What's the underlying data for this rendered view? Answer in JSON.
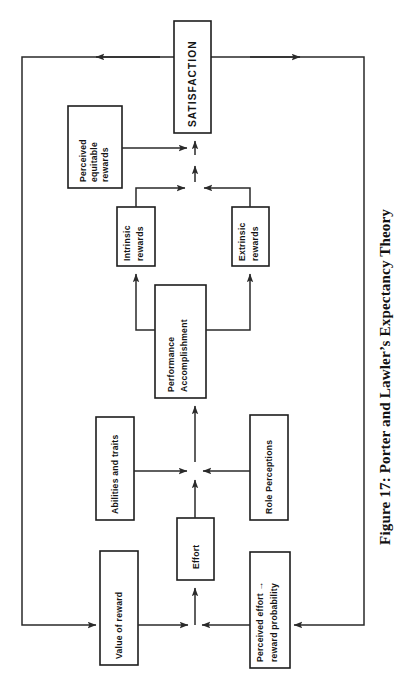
{
  "figure": {
    "caption": "Figure 17: Porter and Lawler’s Expectancy Theory",
    "orientation": "rotated-90-ccw",
    "canvas": {
      "width": 406,
      "height": 688
    },
    "colors": {
      "background": "#ffffff",
      "box_stroke": "#1d1d1d",
      "box_fill": "#ffffff",
      "connector": "#2a2a2a",
      "text": "#141414"
    }
  },
  "nodes": [
    {
      "id": "satisfaction",
      "label": "SATISFACTION",
      "style": "caps",
      "lines": [
        "SATISFACTION"
      ],
      "rect": {
        "x": 174,
        "y": 21,
        "w": 37,
        "h": 112
      }
    },
    {
      "id": "perceived-equitable-rewards",
      "label": "Perceived equitable rewards",
      "style": "normal",
      "lines": [
        "Perceived",
        "equitable",
        "rewards"
      ],
      "rect": {
        "x": 68,
        "y": 106,
        "w": 54,
        "h": 82
      }
    },
    {
      "id": "intrinsic-rewards",
      "label": "Intrinsic rewards",
      "style": "normal",
      "lines": [
        "Intrinsic",
        "rewards"
      ],
      "rect": {
        "x": 117,
        "y": 207,
        "w": 38,
        "h": 59
      }
    },
    {
      "id": "extrinsic-rewards",
      "label": "Extrinsic rewards",
      "style": "normal",
      "lines": [
        "Extrinsic",
        "rewards"
      ],
      "rect": {
        "x": 232,
        "y": 207,
        "w": 37,
        "h": 59
      }
    },
    {
      "id": "performance-accomplishment",
      "label": "Performance Accomplishment",
      "style": "normal",
      "lines": [
        "Performance",
        "Accomplishment"
      ],
      "rect": {
        "x": 155,
        "y": 285,
        "w": 51,
        "h": 113
      }
    },
    {
      "id": "abilities-and-traits",
      "label": "Abilities and traits",
      "style": "normal",
      "lines": [
        "Abilities and traits"
      ],
      "rect": {
        "x": 96,
        "y": 417,
        "w": 38,
        "h": 103
      }
    },
    {
      "id": "role-perceptions",
      "label": "Role Perceptions",
      "style": "normal",
      "lines": [
        "Role Perceptions"
      ],
      "rect": {
        "x": 250,
        "y": 415,
        "w": 38,
        "h": 105
      }
    },
    {
      "id": "effort",
      "label": "Effort",
      "style": "normal",
      "lines": [
        "Effort"
      ],
      "rect": {
        "x": 177,
        "y": 518,
        "w": 37,
        "h": 62
      }
    },
    {
      "id": "value-of-reward",
      "label": "Value of reward",
      "style": "normal",
      "lines": [
        "Value of reward"
      ],
      "rect": {
        "x": 100,
        "y": 551,
        "w": 38,
        "h": 114
      }
    },
    {
      "id": "perceived-effort-reward-probability",
      "label": "Perceived effort → reward probability",
      "style": "normal",
      "lines": [
        "Perceived effort →",
        "reward probability"
      ],
      "rect": {
        "x": 250,
        "y": 552,
        "w": 40,
        "h": 116
      }
    }
  ],
  "edges": [
    {
      "id": "effort-to-performance",
      "from": "effort",
      "to": "performance-accomplishment"
    },
    {
      "id": "abilities-to-performance",
      "from": "abilities-and-traits",
      "to": "performance-accomplishment"
    },
    {
      "id": "role-perceptions-to-performance",
      "from": "role-perceptions",
      "to": "performance-accomplishment"
    },
    {
      "id": "value-of-reward-to-effort",
      "from": "value-of-reward",
      "to": "effort"
    },
    {
      "id": "perceived-effort-prob-to-effort",
      "from": "perceived-effort-reward-probability",
      "to": "effort"
    },
    {
      "id": "performance-to-intrinsic",
      "from": "performance-accomplishment",
      "to": "intrinsic-rewards"
    },
    {
      "id": "performance-to-extrinsic",
      "from": "performance-accomplishment",
      "to": "extrinsic-rewards"
    },
    {
      "id": "intrinsic-to-satisfaction",
      "from": "intrinsic-rewards",
      "to": "satisfaction"
    },
    {
      "id": "extrinsic-to-satisfaction",
      "from": "extrinsic-rewards",
      "to": "satisfaction"
    },
    {
      "id": "perceived-equitable-to-satisfaction",
      "from": "perceived-equitable-rewards",
      "to": "satisfaction"
    },
    {
      "id": "satisfaction-feedback-to-value-of-reward",
      "from": "satisfaction",
      "to": "value-of-reward"
    },
    {
      "id": "satisfaction-feedback-to-perceived-effort-prob",
      "from": "satisfaction",
      "to": "perceived-effort-reward-probability"
    }
  ]
}
